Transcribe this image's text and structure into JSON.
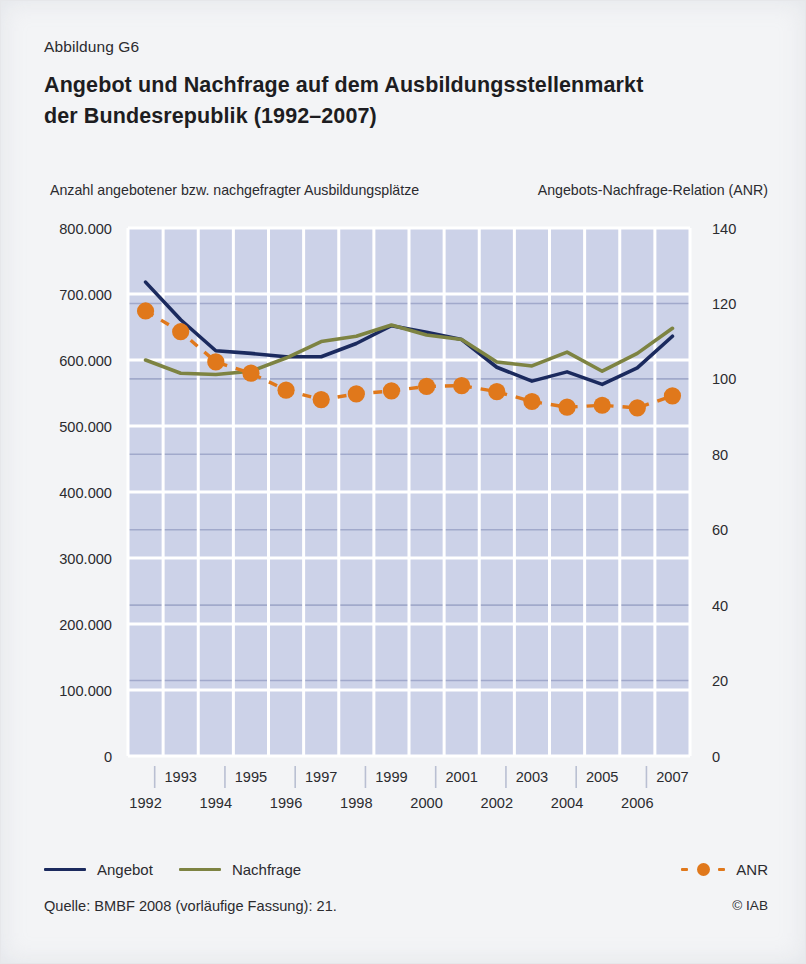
{
  "figure": {
    "label": "Abbildung G6",
    "title_line1": "Angebot und Nachfrage auf dem Ausbildungsstellenmarkt",
    "title_line2": "der Bundesrepublik (1992–2007)"
  },
  "axis_captions": {
    "left": "Anzahl angebotener bzw. nachgefragter Ausbildungsplätze",
    "right": "Angebots-Nachfrage-Relation (ANR)"
  },
  "legend": {
    "angebot": "Angebot",
    "nachfrage": "Nachfrage",
    "anr": "ANR"
  },
  "source": {
    "text": "Quelle: BMBF 2008 (vorläufige Fassung): 21.",
    "copyright": "© IAB"
  },
  "colors": {
    "angebot": "#1b2a5e",
    "nachfrage": "#7d8342",
    "anr": "#e0781b",
    "plot_background": "#ccd2e8",
    "grid_major": "#ffffff",
    "grid_secondary": "#9aa3c6",
    "page_background": "#f3f4f6",
    "text": "#2b2b2f"
  },
  "chart_data": {
    "type": "line",
    "title": "Angebot und Nachfrage auf dem Ausbildungsstellenmarkt der Bundesrepublik (1992–2007)",
    "xlabel": "",
    "ylabel": "Anzahl angebotener bzw. nachgefragter Ausbildungsplätze",
    "y2label": "Angebots-Nachfrage-Relation (ANR)",
    "x": [
      1992,
      1993,
      1994,
      1995,
      1996,
      1997,
      1998,
      1999,
      2000,
      2001,
      2002,
      2003,
      2004,
      2005,
      2006,
      2007
    ],
    "categories": [
      "1992",
      "1993",
      "1994",
      "1995",
      "1996",
      "1997",
      "1998",
      "1999",
      "2000",
      "2001",
      "2002",
      "2003",
      "2004",
      "2005",
      "2006",
      "2007"
    ],
    "x_tick_labels_top": [
      "1993",
      "1995",
      "1997",
      "1999",
      "2001",
      "2003",
      "2005",
      "2007"
    ],
    "x_tick_labels_bottom": [
      "1992",
      "1994",
      "1996",
      "1998",
      "2000",
      "2002",
      "2004",
      "2006"
    ],
    "ylim": [
      0,
      800000
    ],
    "yticks": [
      0,
      100000,
      200000,
      300000,
      400000,
      500000,
      600000,
      700000,
      800000
    ],
    "ytick_labels": [
      "0",
      "100.000",
      "200.000",
      "300.000",
      "400.000",
      "500.000",
      "600.000",
      "700.000",
      "800.000"
    ],
    "y2lim": [
      0,
      140
    ],
    "y2ticks": [
      0,
      20,
      40,
      60,
      80,
      100,
      120,
      140
    ],
    "y2tick_labels": [
      "0",
      "20",
      "40",
      "60",
      "80",
      "100",
      "120",
      "140"
    ],
    "grid": true,
    "legend_position": "bottom",
    "series": [
      {
        "name": "Angebot",
        "axis": "left",
        "style": "line",
        "color": "#1b2a5e",
        "values": [
          718000,
          661000,
          614000,
          610000,
          605000,
          605000,
          625000,
          652000,
          642000,
          631000,
          589000,
          568000,
          582000,
          563000,
          588000,
          636000
        ]
      },
      {
        "name": "Nachfrage",
        "axis": "left",
        "style": "line",
        "color": "#7d8342",
        "values": [
          600000,
          580000,
          578000,
          583000,
          603000,
          628000,
          636000,
          653000,
          638000,
          631000,
          597000,
          591000,
          612000,
          583000,
          610000,
          648000
        ]
      },
      {
        "name": "ANR",
        "axis": "right",
        "style": "dashed-markers",
        "color": "#e0781b",
        "values": [
          118.0,
          112.5,
          104.5,
          101.5,
          97.0,
          94.5,
          96.0,
          96.8,
          98.0,
          98.2,
          96.6,
          94.0,
          92.5,
          93.0,
          92.3,
          95.5
        ]
      }
    ]
  }
}
